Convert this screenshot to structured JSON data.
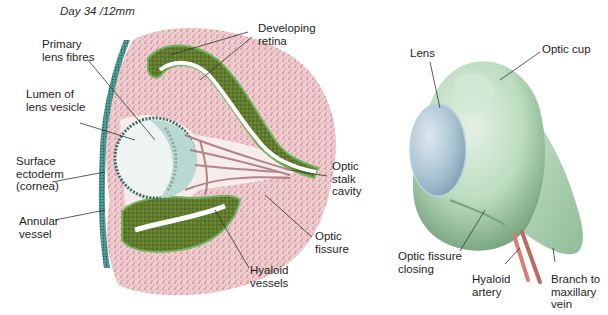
{
  "left_diagram": {
    "title": "Day 34 /12mm",
    "labels": {
      "primary_lens_fibres": "Primary\nlens fibres",
      "lumen_of_lens_vesicle": "Lumen of\nlens vesicle",
      "surface_ectoderm": "Surface\nectoderm\n(cornea)",
      "annular_vessel": "Annular\nvessel",
      "developing_retina": "Developing\nretina",
      "optic_stalk_cavity": "Optic\nstalk\ncavity",
      "optic_fissure": "Optic\nfissure",
      "hyaloid_vessels": "Hyaloid\nvessels"
    }
  },
  "right_diagram": {
    "labels": {
      "lens": "Lens",
      "optic_cup": "Optic cup",
      "optic_fissure_closing": "Optic fissure\nclosing",
      "hyaloid_artery": "Hyaloid\nartery",
      "branch_to_maxillary_vein": "Branch to\nmaxillary\nvein"
    }
  },
  "colors": {
    "mesenchyme": "#e3b5bb",
    "retina_green": "#5d7a2e",
    "retina_edge": "#6fb35c",
    "ectoderm_teal": "#3f8a86",
    "lens_teal": "#b9d8d2",
    "cup_green": "#b7d8bd",
    "lens_blue": "#a9c3d3",
    "vessel_red": "#d67f73"
  }
}
